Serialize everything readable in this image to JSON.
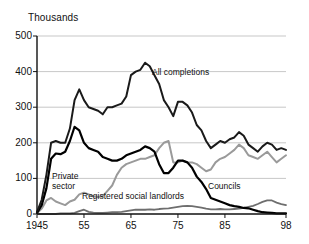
{
  "chart_data": {
    "type": "line",
    "title": "",
    "ylabel": "Thousands",
    "xlabel": "",
    "ylim": [
      0,
      500
    ],
    "xlim": [
      1945,
      1998
    ],
    "grid": true,
    "legend_position": "inline-annotations",
    "yticks": [
      0,
      100,
      200,
      300,
      400,
      500
    ],
    "ytick_labels": [
      "0",
      "100",
      "200",
      "300",
      "400",
      "500"
    ],
    "xticks": [
      1945,
      1955,
      1965,
      1975,
      1985,
      1998
    ],
    "xtick_labels": [
      "1945",
      "55",
      "65",
      "75",
      "85",
      "98"
    ],
    "x": [
      1945,
      1946,
      1947,
      1948,
      1949,
      1950,
      1951,
      1952,
      1953,
      1954,
      1955,
      1956,
      1957,
      1958,
      1959,
      1960,
      1961,
      1962,
      1963,
      1964,
      1965,
      1966,
      1967,
      1968,
      1969,
      1970,
      1971,
      1972,
      1973,
      1974,
      1975,
      1976,
      1977,
      1978,
      1979,
      1980,
      1981,
      1982,
      1983,
      1984,
      1985,
      1986,
      1987,
      1988,
      1989,
      1990,
      1991,
      1992,
      1993,
      1994,
      1995,
      1996,
      1997,
      1998
    ],
    "series": [
      {
        "name": "All completions",
        "color": "#1a1a1a",
        "width": 2.0,
        "label": "All completions",
        "label_x": 152,
        "label_y": 68,
        "values": [
          5,
          40,
          110,
          200,
          205,
          200,
          200,
          240,
          320,
          350,
          320,
          300,
          295,
          290,
          280,
          300,
          300,
          305,
          310,
          330,
          390,
          400,
          405,
          425,
          415,
          390,
          365,
          320,
          300,
          275,
          315,
          315,
          305,
          285,
          250,
          235,
          205,
          185,
          195,
          205,
          200,
          210,
          215,
          230,
          220,
          195,
          185,
          175,
          190,
          200,
          195,
          180,
          185,
          180
        ]
      },
      {
        "name": "Private sector",
        "color": "#9a9a9a",
        "width": 2.0,
        "label_lines": [
          "Private",
          "sector"
        ],
        "label_x": 52,
        "label_y": 172,
        "values": [
          2,
          15,
          38,
          45,
          35,
          30,
          25,
          35,
          40,
          55,
          60,
          55,
          50,
          48,
          50,
          65,
          80,
          110,
          130,
          140,
          145,
          150,
          155,
          155,
          160,
          165,
          185,
          200,
          205,
          145,
          145,
          150,
          145,
          145,
          140,
          130,
          120,
          125,
          145,
          155,
          160,
          170,
          180,
          195,
          185,
          165,
          160,
          155,
          165,
          175,
          160,
          145,
          155,
          165
        ]
      },
      {
        "name": "Councils",
        "color": "#000000",
        "width": 2.2,
        "label": "Councils",
        "label_x": 208,
        "label_y": 182,
        "values": [
          3,
          25,
          72,
          155,
          170,
          168,
          175,
          205,
          245,
          235,
          200,
          185,
          180,
          175,
          160,
          155,
          150,
          150,
          155,
          165,
          170,
          175,
          180,
          190,
          185,
          175,
          140,
          115,
          115,
          130,
          150,
          150,
          145,
          130,
          105,
          90,
          70,
          45,
          40,
          35,
          30,
          25,
          22,
          20,
          17,
          16,
          12,
          8,
          5,
          4,
          3,
          2,
          2,
          2
        ]
      },
      {
        "name": "Registered social landlords",
        "color": "#6e6e6e",
        "width": 1.8,
        "label": "Registered social landlords",
        "label_x": 82,
        "label_y": 192,
        "values": [
          0,
          0,
          0,
          0,
          0,
          2,
          2,
          2,
          3,
          8,
          12,
          6,
          4,
          3,
          3,
          4,
          5,
          5,
          6,
          8,
          10,
          12,
          12,
          12,
          13,
          12,
          14,
          15,
          16,
          18,
          20,
          22,
          23,
          22,
          20,
          18,
          15,
          13,
          13,
          14,
          13,
          13,
          14,
          15,
          17,
          20,
          23,
          28,
          34,
          38,
          38,
          32,
          28,
          25
        ]
      }
    ]
  },
  "geometry": {
    "plot_left": 37,
    "plot_right": 286,
    "plot_top": 36,
    "plot_bottom": 214
  }
}
